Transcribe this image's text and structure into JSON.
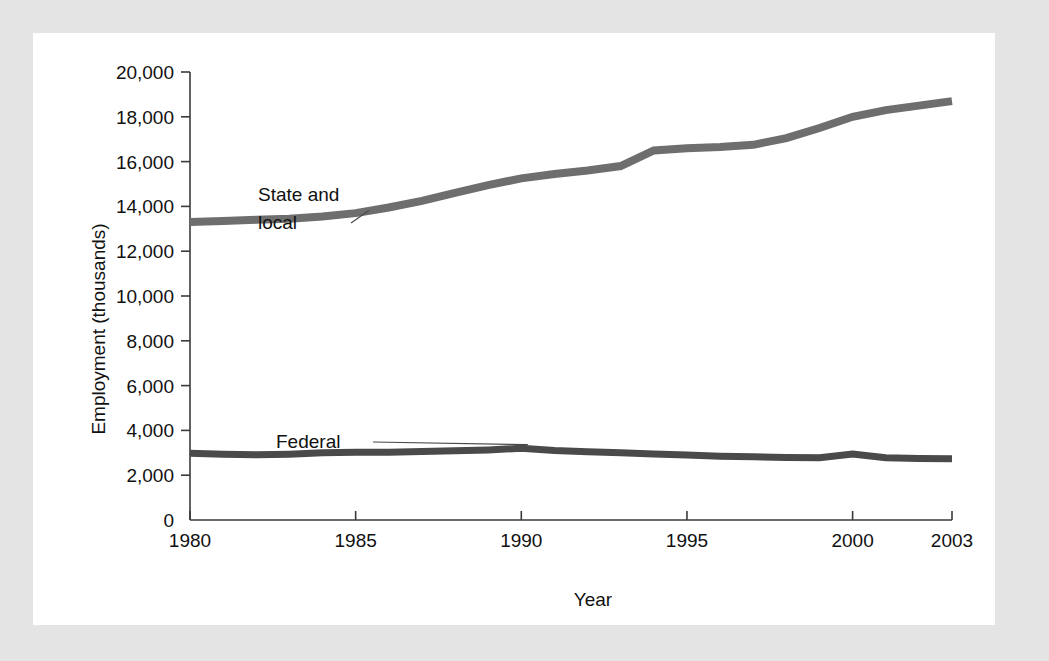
{
  "chart_data": {
    "type": "line",
    "title": "",
    "xlabel": "Year",
    "ylabel": "Employment (thousands)",
    "xlim": [
      1980,
      2003
    ],
    "ylim": [
      0,
      20000
    ],
    "grid": false,
    "legend_position": "inline-annotations",
    "x": [
      1980,
      1981,
      1982,
      1983,
      1984,
      1985,
      1986,
      1987,
      1988,
      1989,
      1990,
      1991,
      1992,
      1993,
      1994,
      1995,
      1996,
      1997,
      1998,
      1999,
      2000,
      2001,
      2002,
      2003
    ],
    "xticks": [
      1980,
      1985,
      1990,
      1995,
      2000,
      2003
    ],
    "xtick_labels": [
      "1980",
      "1985",
      "1990",
      "1995",
      "2000",
      "2003"
    ],
    "yticks": [
      0,
      2000,
      4000,
      6000,
      8000,
      10000,
      12000,
      14000,
      16000,
      18000,
      20000
    ],
    "ytick_labels": [
      "0",
      "2,000",
      "4,000",
      "6,000",
      "8,000",
      "10,000",
      "12,000",
      "14,000",
      "16,000",
      "18,000",
      "20,000"
    ],
    "series": [
      {
        "name": "State and local",
        "color": "#6e6e6e",
        "line_width": 8,
        "label_text_1": "State and",
        "label_text_2": "local",
        "values": [
          13300,
          13350,
          13400,
          13450,
          13550,
          13700,
          13950,
          14250,
          14600,
          14950,
          15250,
          15450,
          15600,
          15800,
          16500,
          16600,
          16650,
          16750,
          17050,
          17500,
          18000,
          18300,
          18500,
          18700
        ]
      },
      {
        "name": "Federal",
        "color": "#4a4a4a",
        "line_width": 7,
        "label_text_1": "Federal",
        "values": [
          2980,
          2940,
          2910,
          2940,
          3000,
          3020,
          3030,
          3060,
          3090,
          3130,
          3200,
          3100,
          3050,
          3000,
          2950,
          2900,
          2850,
          2820,
          2790,
          2780,
          2950,
          2780,
          2750,
          2730
        ]
      }
    ],
    "annotations": [
      {
        "name": "state-and-local-label",
        "line1": "State and",
        "line2": "local"
      },
      {
        "name": "federal-label",
        "line1": "Federal"
      }
    ]
  },
  "colors": {
    "page_background": "#e4e4e4",
    "panel_background": "#ffffff",
    "axis": "#3a3a3a",
    "text": "#111111",
    "state_local_line": "#6e6e6e",
    "federal_line": "#4a4a4a"
  }
}
